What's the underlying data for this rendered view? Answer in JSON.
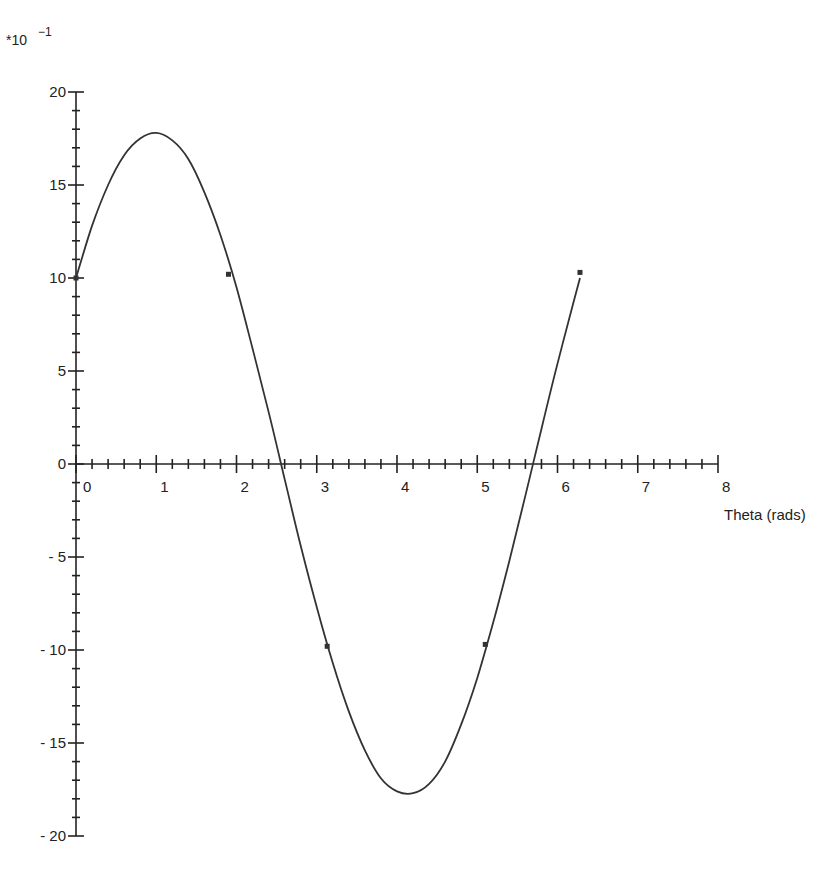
{
  "chart_data": {
    "type": "line",
    "title": "",
    "xlabel": "Theta (rads)",
    "ylabel": "",
    "y_multiplier": "*10",
    "y_multiplier_exp": "−1",
    "xlim": [
      0,
      8
    ],
    "ylim": [
      -20,
      20
    ],
    "grid": false,
    "legend": null,
    "x_ticks": [
      0,
      1,
      2,
      3,
      4,
      5,
      6,
      7,
      8
    ],
    "x_tick_labels": [
      "0",
      "1",
      "2",
      "3",
      "4",
      "5",
      "6",
      "7",
      "8"
    ],
    "y_ticks": [
      20,
      15,
      10,
      5,
      0,
      -5,
      -10,
      -15,
      -20
    ],
    "y_tick_labels": [
      "20",
      "15",
      "10",
      "5",
      "0",
      "-5",
      "-10",
      "-15",
      "-20"
    ],
    "x_minor_per_major": 5,
    "y_minor_per_major": 5,
    "series": [
      {
        "name": "curve",
        "x": [
          0,
          0.2,
          0.4,
          0.6,
          0.8,
          1.0,
          1.2,
          1.4,
          1.6,
          1.8,
          2.0,
          2.2,
          2.4,
          2.6,
          2.8,
          3.0,
          3.2,
          3.4,
          3.6,
          3.8,
          4.0,
          4.2,
          4.4,
          4.6,
          4.8,
          5.0,
          5.2,
          5.4,
          5.6,
          5.8,
          6.0,
          6.2,
          6.28
        ],
        "y": [
          10.0,
          12.8,
          15.0,
          16.6,
          17.5,
          17.8,
          17.4,
          16.4,
          14.6,
          12.3,
          9.5,
          6.2,
          2.8,
          -0.8,
          -4.4,
          -7.7,
          -10.7,
          -13.3,
          -15.4,
          -16.9,
          -17.6,
          -17.7,
          -17.2,
          -16.0,
          -14.0,
          -11.5,
          -8.5,
          -5.2,
          -1.7,
          1.9,
          5.4,
          8.7,
          10.0
        ]
      }
    ],
    "markers": {
      "x": [
        0,
        1.9,
        3.13,
        5.1,
        6.28
      ],
      "y": [
        10.0,
        10.2,
        -9.8,
        -9.7,
        10.3
      ]
    }
  }
}
